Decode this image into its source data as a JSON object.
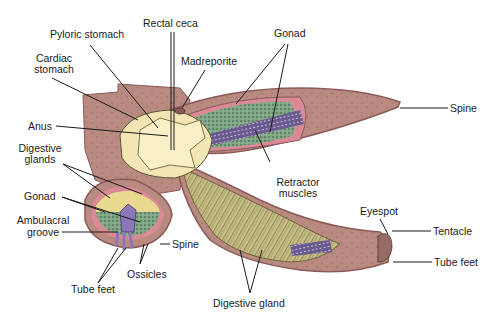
{
  "diagram": {
    "colors": {
      "body_wall": "#b98a80",
      "body_wall_edge": "#8a5a58",
      "coelom_lining": "#d98a96",
      "stomach": "#f4e6b4",
      "digestive_gland": "#c9bf86",
      "gonad": "#7fa786",
      "retractor_muscle": "#6a5a8e",
      "tube_feet": "#8a78b8",
      "leader_line": "#1a1a1a"
    },
    "labels": {
      "pyloric_stomach": "Pyloric stomach",
      "rectal_ceca": "Rectal ceca",
      "cardiac_stomach_l1": "Cardiac",
      "cardiac_stomach_l2": "stomach",
      "madreporite": "Madreporite",
      "gonad_top": "Gonad",
      "spine_right": "Spine",
      "anus": "Anus",
      "digestive_glands_l1": "Digestive",
      "digestive_glands_l2": "glands",
      "retractor_l1": "Retractor",
      "retractor_l2": "muscles",
      "gonad_left": "Gonad",
      "ambulacral_l1": "Ambulacral",
      "ambulacral_l2": "groove",
      "eyespot": "Eyespot",
      "tentacle": "Tentacle",
      "spine_bottom": "Spine",
      "tube_feet_right": "Tube feet",
      "ossicles": "Ossicles",
      "tube_feet_left": "Tube feet",
      "digestive_gland": "Digestive gland"
    }
  }
}
